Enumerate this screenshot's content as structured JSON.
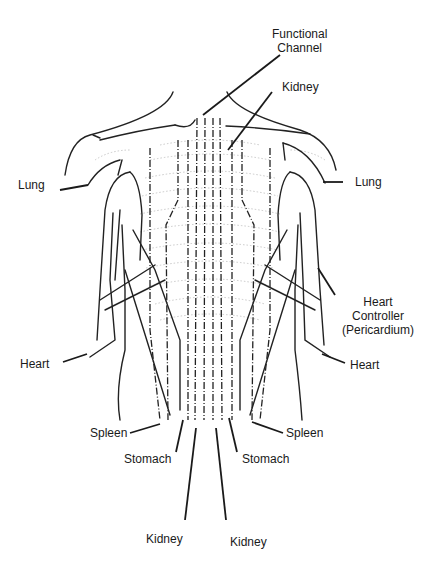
{
  "diagram": {
    "line_color": "#222222",
    "rib_color": "#bbbbbb",
    "labels": {
      "functional_channel": [
        "Functional",
        "Channel"
      ],
      "kidney_top": "Kidney",
      "lung_left": "Lung",
      "lung_right": "Lung",
      "heart_controller": [
        "Heart",
        "Controller",
        "(Pericardium)"
      ],
      "heart_left": "Heart",
      "heart_right": "Heart",
      "spleen_left": "Spleen",
      "spleen_right": "Spleen",
      "stomach_left": "Stomach",
      "stomach_right": "Stomach",
      "kidney_bottom_left": "Kidney",
      "kidney_bottom_right": "Kidney"
    }
  }
}
